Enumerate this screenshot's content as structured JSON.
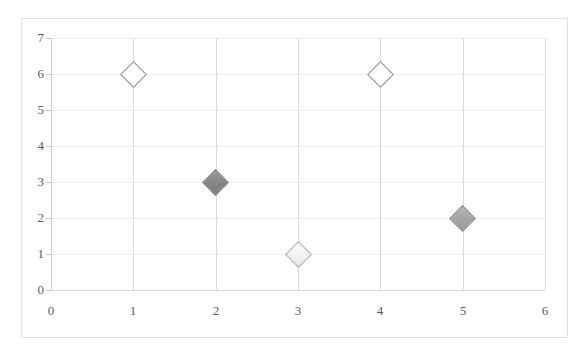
{
  "chart_data": {
    "type": "scatter",
    "title": "",
    "xlabel": "",
    "ylabel": "",
    "xlim": [
      0,
      6
    ],
    "ylim": [
      0,
      7
    ],
    "grid": true,
    "legend": "none",
    "x_ticks": [
      "0",
      "1",
      "2",
      "3",
      "4",
      "5",
      "6"
    ],
    "y_ticks": [
      "0",
      "1",
      "2",
      "3",
      "4",
      "5",
      "6",
      "7"
    ],
    "marker_shape": "diamond",
    "points": [
      {
        "x": 1,
        "y": 6,
        "style": "hollow",
        "fill_color": "#ffffff",
        "edge_color": "#8c8c8c"
      },
      {
        "x": 2,
        "y": 3,
        "style": "fill-dark",
        "fill_color": "#868686",
        "edge_color": "#6f6f6f"
      },
      {
        "x": 3,
        "y": 1,
        "style": "fill-light",
        "fill_color": "#f3f3f3",
        "edge_color": "#a9a9a9"
      },
      {
        "x": 4,
        "y": 6,
        "style": "hollow",
        "fill_color": "#ffffff",
        "edge_color": "#8c8c8c"
      },
      {
        "x": 5,
        "y": 2,
        "style": "fill-mid",
        "fill_color": "#a4a4a4",
        "edge_color": "#7d7d7d"
      }
    ],
    "colors": {
      "background": "#ffffff",
      "frame_border": "#e2e2e2",
      "gridline_horizontal": "#eeeeee",
      "gridline_vertical": "#d8d8d8",
      "axis_line": "#d0d0d0",
      "tick_label": "#5a5a5a"
    }
  }
}
